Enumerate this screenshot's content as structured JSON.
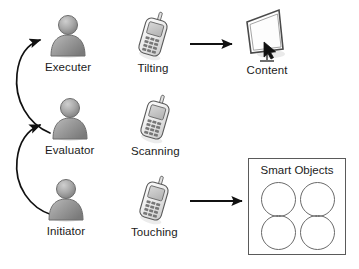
{
  "diagram": {
    "type": "flow-diagram",
    "background_color": "#ffffff",
    "stroke_color": "#1b1b1b",
    "actor_fill": "#9a9a9a"
  },
  "rows": [
    {
      "actor": {
        "label": "Executer",
        "icon": "person-icon"
      },
      "action": {
        "label": "Tilting",
        "icon": "mobile-phone-icon"
      },
      "target": {
        "label": "Content",
        "icon": "display-screen-icon"
      },
      "has_arrow_to_target": true
    },
    {
      "actor": {
        "label": "Evaluator",
        "icon": "person-icon"
      },
      "action": {
        "label": "Scanning",
        "icon": "mobile-phone-icon"
      },
      "target": null,
      "has_arrow_to_target": false
    },
    {
      "actor": {
        "label": "Initiator",
        "icon": "person-icon"
      },
      "action": {
        "label": "Touching",
        "icon": "mobile-phone-icon"
      },
      "target": {
        "label": "Smart Objects",
        "icon": "smart-objects-box-icon"
      },
      "has_arrow_to_target": true
    }
  ],
  "smart_objects": {
    "title": "Smart Objects",
    "circle_count": 4
  },
  "feedback_arrows": [
    {
      "from": "Initiator",
      "to": "Evaluator",
      "style": "curved"
    },
    {
      "from": "Evaluator",
      "to": "Executer",
      "style": "curved"
    }
  ]
}
